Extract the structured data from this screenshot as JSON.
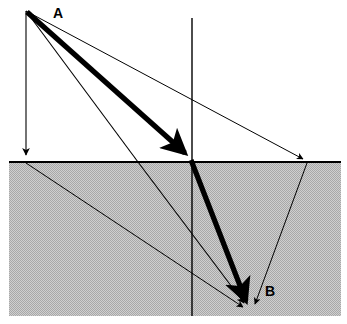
{
  "figure": {
    "width": 347,
    "height": 324,
    "background_color": "#ffffff"
  },
  "labels": {
    "source": "A",
    "receiver": "B"
  },
  "colors": {
    "line": "#000000",
    "layer_fill": "#c2c2c2",
    "layer_pattern_dot": "#9a9a9a",
    "background": "#ffffff"
  },
  "geometry": {
    "interface_y": 162,
    "interface_x_start": 9,
    "interface_x_end": 341,
    "lower_layer_bottom": 316,
    "source_point": {
      "x": 26,
      "y": 11
    },
    "receiver_point": {
      "x": 249,
      "y": 311
    },
    "vertical_axis": {
      "x": 192,
      "y_top": 18,
      "y_bottom": 316
    }
  },
  "rays": [
    {
      "name": "vertical-ray",
      "style": "thin",
      "arrowhead": "at-interface",
      "points": [
        [
          26,
          11
        ],
        [
          26,
          158
        ]
      ],
      "description": "Vertical downgoing ray from A to the interface"
    },
    {
      "name": "short-offset-ray",
      "style": "thin",
      "arrowhead": "at-receiver",
      "points": [
        [
          26,
          11
        ],
        [
          138,
          162
        ],
        [
          249,
          311
        ]
      ],
      "description": "Refracted ray from A crossing interface at x=138 to B"
    },
    {
      "name": "direct-ray",
      "style": "thick",
      "arrowhead": "at-interface-and-receiver",
      "points": [
        [
          26,
          11
        ],
        [
          192,
          162
        ],
        [
          249,
          311
        ]
      ],
      "description": "Principal thick ray from A to interface apex then to B"
    },
    {
      "name": "wide-offset-ray",
      "style": "thin",
      "arrowhead": "at-interface-and-receiver",
      "points": [
        [
          26,
          11
        ],
        [
          307,
          162
        ],
        [
          249,
          311
        ]
      ],
      "description": "Wide-angle ray from A refracting at x=307 back to B"
    },
    {
      "name": "interface-to-receiver-ray",
      "style": "thin",
      "arrowhead": "at-receiver",
      "points": [
        [
          26,
          162
        ],
        [
          249,
          311
        ]
      ],
      "description": "Ray continuing from the vertical ray's interface point to B"
    }
  ],
  "layer_labels": {
    "upper_layer": "",
    "lower_layer": ""
  }
}
